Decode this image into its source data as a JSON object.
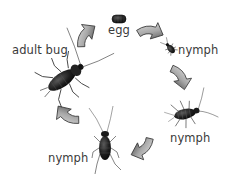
{
  "diagram": {
    "title": "",
    "type": "life-cycle",
    "stages": [
      {
        "id": "egg",
        "label": "egg"
      },
      {
        "id": "nymph-1",
        "label": "nymph"
      },
      {
        "id": "nymph-2",
        "label": "nymph"
      },
      {
        "id": "nymph-3",
        "label": "nymph"
      },
      {
        "id": "adult",
        "label": "adult bug"
      }
    ],
    "flow": [
      "egg",
      "nymph-1",
      "nymph-2",
      "nymph-3",
      "adult",
      "egg"
    ],
    "colors": {
      "background": "#ffffff",
      "label_text": "#3a3a3a",
      "insect_body": "#1a1a1a",
      "arrow_light": "#e8e8e8",
      "arrow_dark": "#555555"
    }
  }
}
